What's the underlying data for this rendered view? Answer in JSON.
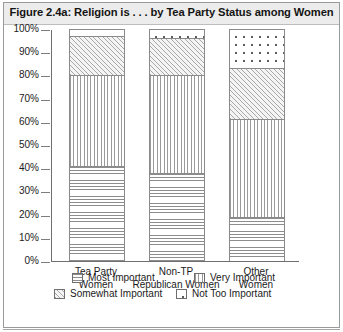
{
  "figure": {
    "title": "Figure 2.4a: Religion is . . . by Tea Party Status among Women"
  },
  "chart_data": {
    "type": "bar",
    "subtype": "stacked-percent-column",
    "title": "Figure 2.4a: Religion is . . . by Tea Party Status among Women",
    "xlabel": "",
    "ylabel": "",
    "ylim": [
      0,
      100
    ],
    "yticks": [
      "0%",
      "10%",
      "20%",
      "30%",
      "40%",
      "50%",
      "60%",
      "70%",
      "80%",
      "90%",
      "100%"
    ],
    "ytick_values": [
      0,
      10,
      20,
      30,
      40,
      50,
      60,
      70,
      80,
      90,
      100
    ],
    "grid": true,
    "legend_position": "bottom",
    "categories": [
      "Tea Party Women",
      "Non-TP Republican Women",
      "Other Women"
    ],
    "category_lines": [
      [
        "Tea Party",
        "Women"
      ],
      [
        "Non-TP",
        "Republican Women"
      ],
      [
        "Other",
        "Women"
      ]
    ],
    "series": [
      {
        "name": "Most Important",
        "pattern": "horizontal-lines",
        "values": [
          41,
          38,
          19
        ]
      },
      {
        "name": "Very Important",
        "pattern": "vertical-lines",
        "values": [
          39,
          42,
          42
        ]
      },
      {
        "name": "Somewhat Important",
        "pattern": "diagonal-hatch",
        "values": [
          17,
          16,
          22
        ]
      },
      {
        "name": "Not Too Important",
        "pattern": "dots",
        "values": [
          3,
          4,
          17
        ]
      }
    ],
    "cumulative_tops": [
      [
        41,
        80,
        97,
        100
      ],
      [
        38,
        80,
        96,
        100
      ],
      [
        19,
        61,
        83,
        100
      ]
    ]
  },
  "legend": {
    "items": [
      {
        "label": "Most Important",
        "pattern": "horizontal-lines"
      },
      {
        "label": "Very Important",
        "pattern": "vertical-lines"
      },
      {
        "label": "Somewhat Important",
        "pattern": "diagonal-hatch"
      },
      {
        "label": "Not Too Important",
        "pattern": "dots"
      }
    ]
  },
  "colors": {
    "frame": "#9a9a9a",
    "title_band": "#ececec",
    "axis": "#6f6f6f",
    "gridline": "#7d7d7d",
    "text": "#1b1b1b",
    "hatch": "#8d8d8d"
  }
}
